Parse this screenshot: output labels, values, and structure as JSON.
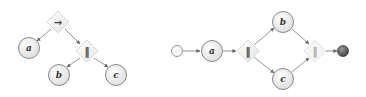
{
  "left_tree": {
    "operators": {
      "root": "→",
      "child": "‖"
    },
    "leaves": {
      "a": "a",
      "b": "b",
      "c": "c"
    }
  },
  "right_net": {
    "activities": {
      "a": "a",
      "b": "b",
      "c": "c"
    },
    "gateways": {
      "split": "‖",
      "join": "‖"
    }
  },
  "colors": {
    "edge": "#777777",
    "node_stroke": "#8a8a8a",
    "node_fill": "#f2f2f2",
    "end_fill": "#5a5a5a"
  }
}
